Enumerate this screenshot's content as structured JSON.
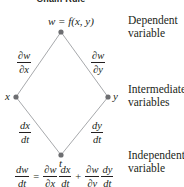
{
  "diagram": {
    "title": "Chain Rule",
    "nodes": {
      "top": {
        "label": "w = f(x, y)",
        "x": 61,
        "y": 32
      },
      "left": {
        "label": "x",
        "x": 16,
        "y": 97
      },
      "right": {
        "label": "y",
        "x": 108,
        "y": 97
      },
      "bottom": {
        "label": "t",
        "x": 61,
        "y": 155
      }
    },
    "edges": [
      {
        "from": "top",
        "to": "left",
        "label_num": "∂w",
        "label_den": "∂x"
      },
      {
        "from": "top",
        "to": "right",
        "label_num": "∂w",
        "label_den": "∂y"
      },
      {
        "from": "left",
        "to": "bottom",
        "label_num": "dx",
        "label_den": "dt"
      },
      {
        "from": "right",
        "to": "bottom",
        "label_num": "dy",
        "label_den": "dt"
      }
    ],
    "side_labels": {
      "dependent": "Dependent variable",
      "dependent_line1": "Dependent",
      "dependent_line2": "variable",
      "intermediate_line1": "Intermediate",
      "intermediate_line2": "variables",
      "independent_line1": "Independent",
      "independent_line2": "variable"
    },
    "formula": {
      "lhs_num": "dw",
      "lhs_den": "dt",
      "eq": "=",
      "t1a_num": "∂w",
      "t1a_den": "∂x",
      "t1b_num": "dx",
      "t1b_den": "dt",
      "plus": "+",
      "t2a_num": "∂w",
      "t2a_den": "∂y",
      "t2b_num": "dy",
      "t2b_den": "dt"
    },
    "colors": {
      "line": "#a7a9ac",
      "dot": "#6d6e71",
      "text": "#231f20"
    }
  }
}
